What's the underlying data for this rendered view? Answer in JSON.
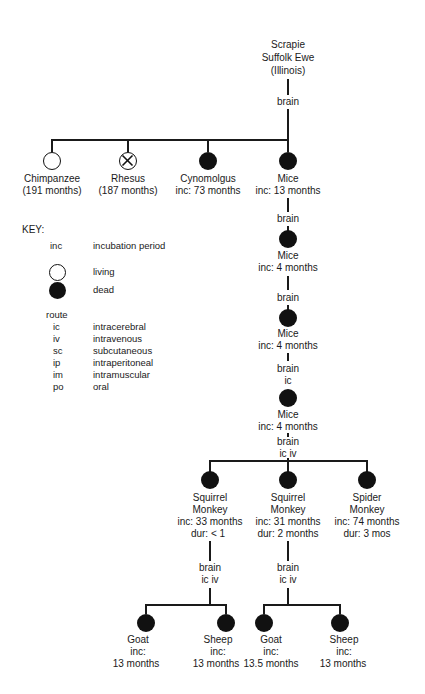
{
  "root": {
    "lines": [
      "Scrapie",
      "Suffolk Ewe",
      "(Illinois)"
    ],
    "route": "brain"
  },
  "level1": [
    {
      "name": "Chimpanzee",
      "detail": "(191 months)",
      "status": "living"
    },
    {
      "name": "Rhesus",
      "detail": "(187 months)",
      "status": "crossed"
    },
    {
      "name": "Cynomolgus",
      "detail": "inc: 73 months",
      "status": "dead"
    },
    {
      "name": "Mice",
      "detail": "inc: 13 months",
      "status": "dead"
    }
  ],
  "mice_chain": [
    {
      "route": "brain",
      "name": "Mice",
      "detail": "inc: 4 months"
    },
    {
      "route": "brain",
      "name": "Mice",
      "detail": "inc: 4 months"
    },
    {
      "route": "brain",
      "route2": "ic",
      "name": "Mice",
      "detail": "inc: 4 months"
    }
  ],
  "level5_route": {
    "line1": "brain",
    "line2": "ic iv"
  },
  "level5": [
    {
      "name1": "Squirrel",
      "name2": "Monkey",
      "inc": "inc: 33 months",
      "dur": "dur: < 1"
    },
    {
      "name1": "Squirrel",
      "name2": "Monkey",
      "inc": "inc: 31 months",
      "dur": "dur: 2 months"
    },
    {
      "name1": "Spider",
      "name2": "Monkey",
      "inc": "inc: 74 months",
      "dur": "dur: 3 mos"
    }
  ],
  "level6_routes": [
    {
      "line1": "brain",
      "line2": "ic iv"
    },
    {
      "line1": "brain",
      "line2": "ic iv"
    }
  ],
  "level6": [
    {
      "name": "Goat",
      "inc": "inc:",
      "value": "13 months"
    },
    {
      "name": "Sheep",
      "inc": "inc:",
      "value": "13 months"
    },
    {
      "name": "Goat",
      "inc": "inc:",
      "value": "13.5 months"
    },
    {
      "name": "Sheep",
      "inc": "inc:",
      "value": "13 months"
    }
  ],
  "key": {
    "title": "KEY:",
    "inc_abbr": "inc",
    "inc_label": "incubation period",
    "living_label": "living",
    "dead_label": "dead",
    "route_title": "route",
    "routes": [
      {
        "abbr": "ic",
        "label": "intracerebral"
      },
      {
        "abbr": "iv",
        "label": "intravenous"
      },
      {
        "abbr": "sc",
        "label": "subcutaneous"
      },
      {
        "abbr": "ip",
        "label": "intraperitoneal"
      },
      {
        "abbr": "im",
        "label": "intramuscular"
      },
      {
        "abbr": "po",
        "label": "oral"
      }
    ]
  }
}
